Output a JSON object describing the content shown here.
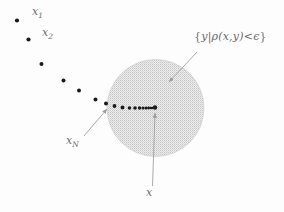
{
  "figure": {
    "background_color": "#fdfdfd",
    "label_color": "#6e6e6e"
  },
  "labels": {
    "x1": {
      "base": "x",
      "sub": "1"
    },
    "x2": {
      "base": "x",
      "sub": "2"
    },
    "xN": {
      "base": "x",
      "sub": "N"
    },
    "x": {
      "base": "x",
      "sub": ""
    },
    "set_open": "{",
    "set_y": "y",
    "set_bar": "|",
    "set_rho": "ρ",
    "set_args": "(x,y)",
    "set_rel": "<",
    "set_eps": "ϵ",
    "set_close": "}",
    "set_full": "{y | ρ(x,y) < ϵ}"
  },
  "disk": {
    "name": "epsilon-ball",
    "cx": 155.5,
    "cy": 108,
    "r": 48.5,
    "fill_color": "#e3e3e3",
    "stipple_color": "#bdbdbd",
    "edge_color": "#c8c8c8"
  },
  "sequence": {
    "dot_color": "#1a1a1a",
    "points": [
      {
        "id": "x1",
        "cx": 17.0,
        "cy": 20.5,
        "r": 2.1
      },
      {
        "id": "x2",
        "cx": 28.5,
        "cy": 39.5,
        "r": 2.1
      },
      {
        "id": "x3",
        "cx": 41.5,
        "cy": 64.0,
        "r": 2.0
      },
      {
        "id": "x4",
        "cx": 63.5,
        "cy": 80.5,
        "r": 2.0
      },
      {
        "id": "x5",
        "cx": 79.0,
        "cy": 90.5,
        "r": 2.0
      },
      {
        "id": "x6",
        "cx": 95.5,
        "cy": 99.5,
        "r": 2.0
      },
      {
        "id": "x7",
        "cx": 106.0,
        "cy": 103.5,
        "r": 2.0
      },
      {
        "id": "x8",
        "cx": 114.5,
        "cy": 106.0,
        "r": 1.9
      },
      {
        "id": "x9",
        "cx": 122.5,
        "cy": 107.5,
        "r": 1.9
      },
      {
        "id": "x10",
        "cx": 129.5,
        "cy": 108.0,
        "r": 1.8
      },
      {
        "id": "x11",
        "cx": 135.0,
        "cy": 108.0,
        "r": 1.8
      },
      {
        "id": "x12",
        "cx": 139.5,
        "cy": 108.0,
        "r": 1.7
      },
      {
        "id": "x13",
        "cx": 143.0,
        "cy": 108.0,
        "r": 1.6
      },
      {
        "id": "x14",
        "cx": 146.0,
        "cy": 108.0,
        "r": 1.5
      },
      {
        "id": "x15",
        "cx": 148.5,
        "cy": 108.0,
        "r": 1.4
      },
      {
        "id": "x16",
        "cx": 150.5,
        "cy": 108.0,
        "r": 1.3
      },
      {
        "id": "x17",
        "cx": 152.0,
        "cy": 108.0,
        "r": 1.2
      },
      {
        "id": "limit",
        "cx": 155.0,
        "cy": 107.5,
        "r": 2.2
      }
    ]
  },
  "annotations": {
    "set_arrow": {
      "name": "set-label-arrow",
      "x1": 197,
      "y1": 52,
      "x2": 168,
      "y2": 83,
      "color": "#a2a2a2"
    },
    "xn_arrow": {
      "name": "xn-label-arrow",
      "x1": 84,
      "y1": 136,
      "x2": 108,
      "y2": 108,
      "color": "#a2a2a2"
    },
    "x_arrow": {
      "name": "x-label-arrow",
      "x1": 152,
      "y1": 186,
      "x2": 155,
      "y2": 112,
      "color": "#a2a2a2"
    }
  }
}
